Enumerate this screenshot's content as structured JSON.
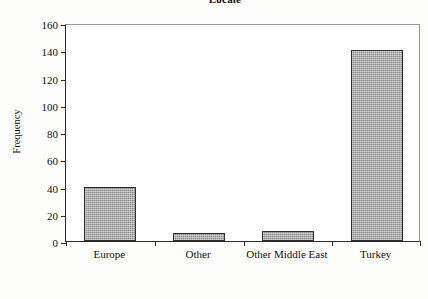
{
  "chart_data": {
    "type": "bar",
    "title": "Locale",
    "xlabel": "",
    "ylabel": "Frequency",
    "categories": [
      "Europe",
      "Other",
      "Other Middle East",
      "Turkey"
    ],
    "values": [
      40,
      6,
      7,
      140
    ],
    "ylim": [
      0,
      160
    ],
    "ytick_labels": [
      "0",
      "20",
      "40",
      "60",
      "80",
      "100",
      "120",
      "140",
      "160"
    ],
    "ytick_values": [
      0,
      20,
      40,
      60,
      80,
      100,
      120,
      140,
      160
    ],
    "grid": false,
    "legend": null,
    "legend_position": "none",
    "series": [
      {
        "name": "Frequency",
        "values": [
          40,
          6,
          7,
          140
        ]
      }
    ],
    "colors": {
      "bar_fill": "#a9a9a9",
      "bar_border": "#2d2d2d",
      "axis": "#2b2b2b",
      "frame": "#9a9a9a",
      "background": "#fdfdfc",
      "text": "#111111"
    }
  }
}
